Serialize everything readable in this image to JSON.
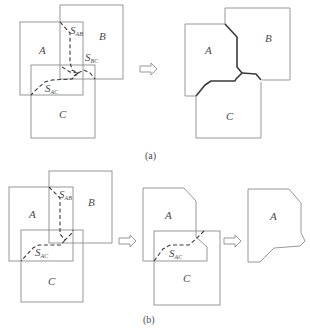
{
  "figure_a": {
    "caption": "(a)",
    "left": {
      "labels": {
        "A": "A",
        "B": "B",
        "C": "C"
      },
      "seam_labels": [
        {
          "main": "S",
          "sub": "AB"
        },
        {
          "main": "S",
          "sub": "BC"
        },
        {
          "main": "S",
          "sub": "AC"
        }
      ]
    },
    "right": {
      "labels": {
        "A": "A",
        "B": "B",
        "C": "C"
      }
    }
  },
  "figure_b": {
    "caption": "(b)",
    "left": {
      "labels": {
        "A": "A",
        "B": "B",
        "C": "C"
      },
      "seam_labels": [
        {
          "main": "S",
          "sub": "AB"
        },
        {
          "main": "S",
          "sub": "AC"
        }
      ]
    },
    "middle": {
      "labels": {
        "A": "A",
        "C": "C"
      },
      "seam_labels": [
        {
          "main": "S",
          "sub": "AC"
        }
      ]
    },
    "right": {
      "labels": {
        "A": "A"
      }
    }
  },
  "arrows": [
    "double-right-arrow",
    "double-right-arrow",
    "double-right-arrow"
  ]
}
